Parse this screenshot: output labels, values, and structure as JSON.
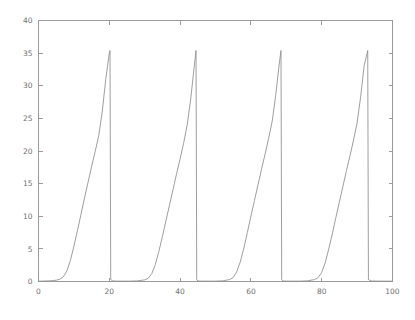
{
  "chart_data": {
    "type": "line",
    "title": "",
    "subtitle": "",
    "xlabel": "",
    "ylabel": "",
    "xlim": [
      0,
      100
    ],
    "ylim": [
      0,
      40
    ],
    "grid": false,
    "legend": null,
    "x_ticks": [
      0,
      20,
      40,
      60,
      80,
      100
    ],
    "x_tick_labels": [
      "0",
      "20",
      "40",
      "60",
      "80",
      "100"
    ],
    "y_ticks": [
      0,
      5,
      10,
      15,
      20,
      25,
      30,
      35,
      40
    ],
    "y_tick_labels": [
      "0",
      "5",
      "10",
      "15",
      "20",
      "25",
      "30",
      "35",
      "40"
    ],
    "series": [
      {
        "name": "signal",
        "color": "#8d8d8d",
        "peak_value": 35.4,
        "baseline_value": 0.0,
        "period": 24.2,
        "peak_x": [
          20.2,
          44.5,
          68.5,
          93.0
        ],
        "rise_start_x": [
          6.5,
          31.0,
          55.2,
          79.6
        ],
        "reset_x": [
          20.4,
          44.7,
          68.7,
          93.2
        ],
        "x": [
          0,
          1,
          2,
          3,
          4,
          5,
          6,
          7,
          8,
          9,
          10,
          11,
          12,
          13,
          14,
          15,
          16,
          17,
          18,
          19,
          20,
          20.2,
          20.4,
          21,
          22,
          24,
          26,
          28,
          30,
          31,
          32,
          33,
          34,
          35,
          36,
          37,
          38,
          39,
          40,
          41,
          42,
          43,
          44,
          44.5,
          44.7,
          45,
          46,
          48,
          50,
          52,
          54,
          55,
          56,
          57,
          58,
          59,
          60,
          61,
          62,
          63,
          64,
          65,
          66,
          67,
          68,
          68.5,
          68.7,
          69,
          70,
          72,
          74,
          76,
          78,
          79,
          80,
          81,
          82,
          83,
          84,
          85,
          86,
          87,
          88,
          89,
          90,
          91,
          92,
          93,
          93.2,
          94,
          96,
          98,
          100
        ],
        "y": [
          0.05,
          0.06,
          0.08,
          0.1,
          0.14,
          0.2,
          0.35,
          0.7,
          1.6,
          3.2,
          5.4,
          7.8,
          10.3,
          12.8,
          15.2,
          17.6,
          19.9,
          22.3,
          26.0,
          31.0,
          35.0,
          35.4,
          0.3,
          0.08,
          0.06,
          0.05,
          0.06,
          0.1,
          0.25,
          0.5,
          1.2,
          2.6,
          4.6,
          6.9,
          9.3,
          11.7,
          14.1,
          16.5,
          18.8,
          21.2,
          24.0,
          28.0,
          33.0,
          35.4,
          0.3,
          0.08,
          0.06,
          0.05,
          0.06,
          0.1,
          0.3,
          0.6,
          1.5,
          3.0,
          5.1,
          7.5,
          10.0,
          12.4,
          14.8,
          17.2,
          19.5,
          21.9,
          24.5,
          28.5,
          33.3,
          35.4,
          0.3,
          0.08,
          0.06,
          0.05,
          0.06,
          0.1,
          0.3,
          0.6,
          1.4,
          2.9,
          5.0,
          7.3,
          9.8,
          12.2,
          14.6,
          17.0,
          19.3,
          21.7,
          24.3,
          28.3,
          33.1,
          35.4,
          0.3,
          0.08,
          0.06,
          0.05,
          0.05
        ]
      }
    ]
  },
  "axes": {
    "frame_color": "#9a9a9a",
    "tick_label_color": "#6f6f6f",
    "background_color": "#ffffff"
  }
}
